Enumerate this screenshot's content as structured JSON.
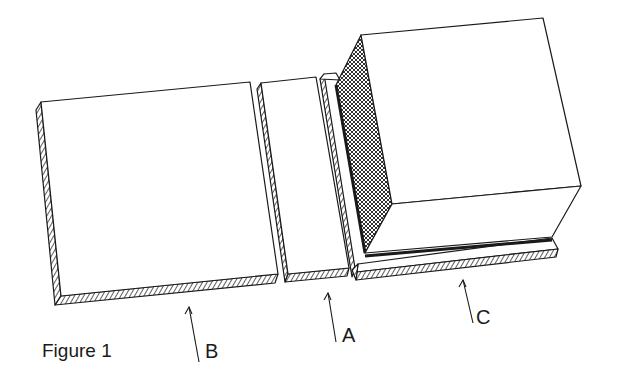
{
  "figure": {
    "caption": "Figure 1",
    "labels": {
      "a": "A",
      "b": "B",
      "c": "C"
    },
    "components": [
      {
        "id": "B",
        "description": "large flat square tile with hatched edges"
      },
      {
        "id": "A",
        "description": "narrow flat strip tile with hatched edges, plus thin upright hatched slab"
      },
      {
        "id": "C",
        "description": "cube block with cross-hatched side face on a hatched base plate"
      }
    ],
    "colors": {
      "line": "#1a1a1a",
      "background": "#ffffff"
    }
  }
}
